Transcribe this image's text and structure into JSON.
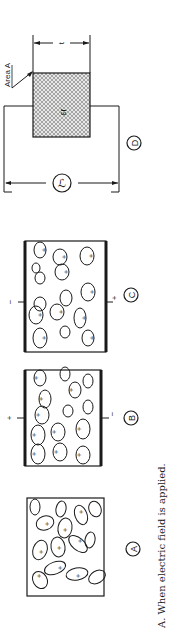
{
  "figure": {
    "rotation_deg": -90,
    "caption": "A. When electric field is applied.",
    "colors": {
      "ink": "#1a1a1a",
      "background": "#ffffff",
      "hatch": "#8a8a8a"
    }
  },
  "panels": [
    {
      "id": "A",
      "label": "A",
      "description": "Randomly oriented dipoles, no field",
      "plates": false,
      "left_terminal": "",
      "right_terminal": ""
    },
    {
      "id": "B",
      "label": "B",
      "description": "Dipoles aligned under field",
      "plates": true,
      "left_terminal": "+",
      "right_terminal": "−"
    },
    {
      "id": "C",
      "label": "C",
      "description": "Dipoles aligned under reversed field",
      "plates": true,
      "left_terminal": "−",
      "right_terminal": "+"
    },
    {
      "id": "D",
      "label": "D",
      "description": "Capacitor with dielectric",
      "area_label": "Area A",
      "thickness_label": "t",
      "permittivity_label": "εr",
      "terminal_symbol": "ℒ"
    }
  ]
}
